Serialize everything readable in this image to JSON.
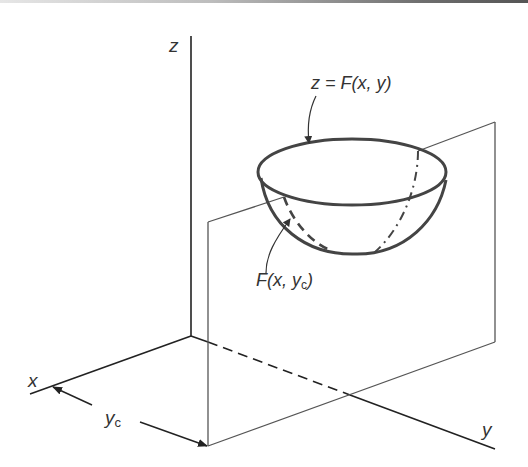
{
  "diagram": {
    "type": "3d-surface-section",
    "axes": {
      "x_label": "x",
      "y_label": "y",
      "z_label": "z"
    },
    "labels": {
      "surface_eq": "z = F(x, y)",
      "section_curve_main": "F(x, ",
      "section_curve_var": "y",
      "section_curve_sub": "c",
      "section_curve_close": ")",
      "dimension_var": "y",
      "dimension_sub": "c"
    },
    "colors": {
      "axis": "#222222",
      "plane": "#555555",
      "surface": "#444444",
      "text": "#333333"
    }
  }
}
